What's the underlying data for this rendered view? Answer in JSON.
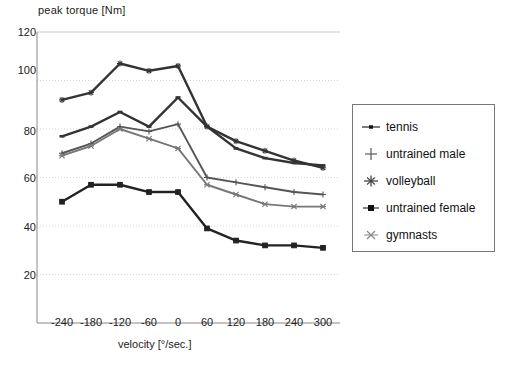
{
  "chart_data": {
    "type": "line",
    "title": "",
    "xlabel": "velocity [°/sec.]",
    "ylabel": "peak torque [Nm]",
    "x": [
      -240,
      -180,
      -120,
      -60,
      0,
      60,
      120,
      180,
      240,
      300
    ],
    "xticklabels": [
      "-240",
      "-180",
      "-120",
      "-60",
      "0",
      "60",
      "120",
      "180",
      "240",
      "300"
    ],
    "yticklabels": [
      "120",
      "100",
      "80",
      "60",
      "40",
      "20"
    ],
    "ylim": [
      0,
      120
    ],
    "xlim": [
      -270,
      330
    ],
    "grid": true,
    "legend_position": "right-outside",
    "series": [
      {
        "name": "volleyball",
        "marker": "asterisk",
        "color": "#333333",
        "values": [
          92,
          95,
          107,
          104,
          106,
          81,
          75,
          71,
          67,
          64
        ]
      },
      {
        "name": "tennis",
        "marker": "dash",
        "color": "#333333",
        "values": [
          77,
          81,
          87,
          81,
          93,
          81,
          72,
          68,
          66,
          65
        ]
      },
      {
        "name": "untrained male",
        "marker": "plus",
        "color": "#555555",
        "values": [
          70,
          74,
          81,
          79,
          82,
          60,
          58,
          56,
          54,
          53
        ]
      },
      {
        "name": "gymnasts",
        "marker": "star",
        "color": "#777777",
        "values": [
          69,
          73,
          80,
          76,
          72,
          57,
          53,
          49,
          48,
          48
        ]
      },
      {
        "name": "untrained female",
        "marker": "square",
        "color": "#222222",
        "values": [
          50,
          57,
          57,
          54,
          54,
          39,
          34,
          32,
          32,
          31
        ]
      }
    ]
  },
  "legend": {
    "entries": [
      {
        "label": "tennis",
        "marker": "dash"
      },
      {
        "label": "untrained male",
        "marker": "plus"
      },
      {
        "label": "volleyball",
        "marker": "asterisk"
      },
      {
        "label": "untrained female",
        "marker": "square"
      },
      {
        "label": "gymnasts",
        "marker": "star"
      }
    ]
  }
}
